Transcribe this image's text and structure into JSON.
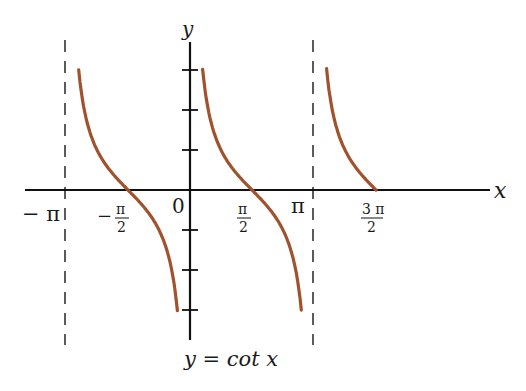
{
  "chart_data": {
    "type": "line",
    "title": "y = cot x",
    "xlabel": "x",
    "ylabel": "y",
    "x_tick_labels": [
      "-π",
      "-π/2",
      "0",
      "π/2",
      "π",
      "3π/2"
    ],
    "x_ticks": [
      -3.1416,
      -1.5708,
      0,
      1.5708,
      3.1416,
      4.7124
    ],
    "y_ticks": [
      -3,
      -2,
      -1,
      1,
      2,
      3
    ],
    "asymptotes": [
      -3.1416,
      0,
      3.1416
    ],
    "xlim": [
      -4.0,
      7.5
    ],
    "ylim": [
      -3.8,
      3.8
    ],
    "grid": false,
    "series": [
      {
        "name": "cot x, branch (-π, 0)",
        "domain": [
          -2.82,
          -0.32
        ],
        "color": "#a0522d"
      },
      {
        "name": "cot x, branch (0, π)",
        "domain": [
          0.32,
          2.82
        ],
        "color": "#a0522d"
      },
      {
        "name": "cot x, branch (π, 3π/2)",
        "domain": [
          3.46,
          4.7124
        ],
        "color": "#a0522d"
      }
    ],
    "sample_points": [
      {
        "x": 0.32,
        "y": 3.0
      },
      {
        "x": 0.785,
        "y": 1.0
      },
      {
        "x": 1.5708,
        "y": 0
      },
      {
        "x": 2.356,
        "y": -1.0
      },
      {
        "x": 2.82,
        "y": -3.0
      }
    ]
  },
  "labels": {
    "y_axis": "y",
    "x_axis": "x",
    "neg_pi": "− π",
    "neg_pi_half_minus": "−",
    "pi_symbol": "π",
    "two": "2",
    "zero": "0",
    "pi": "π",
    "three_pi": "3 π",
    "caption": "y = cot x"
  },
  "colors": {
    "curve": "#a0522d",
    "axis": "#111111"
  }
}
